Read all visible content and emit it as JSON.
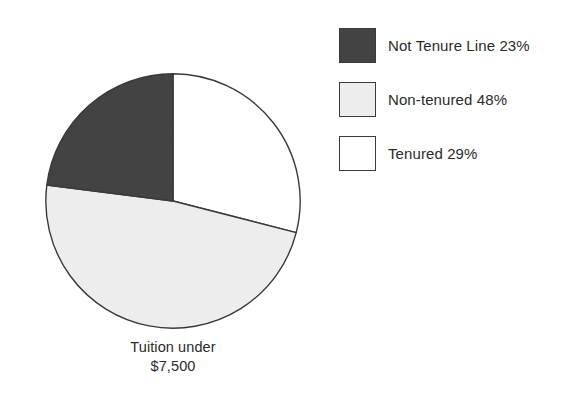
{
  "chart_data": {
    "type": "pie",
    "title": "",
    "caption_line1": "Tuition under",
    "caption_line2": "$7,500",
    "legend_position": "right",
    "grid": false,
    "start_angle_deg": 0,
    "direction": "clockwise",
    "categories": [
      "Tenured",
      "Non-tenured",
      "Not Tenure Line"
    ],
    "values": [
      29,
      48,
      23
    ],
    "value_unit": "%",
    "slices": [
      {
        "name": "Tenured",
        "label": "Tenured 29%",
        "value": 29,
        "color": "#ffffff",
        "start_deg": 0,
        "end_deg": 104.4
      },
      {
        "name": "Non-tenured",
        "label": "Non-tenured 48%",
        "value": 48,
        "color": "#ededed",
        "start_deg": 104.4,
        "end_deg": 277.2
      },
      {
        "name": "Not Tenure Line",
        "label": "Not Tenure Line 23%",
        "value": 23,
        "color": "#434343",
        "start_deg": 277.2,
        "end_deg": 360
      }
    ]
  },
  "legend": {
    "items": [
      {
        "label": "Not Tenure Line 23%",
        "color": "#434343",
        "swatch_name": "legend-swatch-not-tenure-line"
      },
      {
        "label": "Non-tenured 48%",
        "color": "#ededed",
        "swatch_name": "legend-swatch-non-tenured"
      },
      {
        "label": "Tenured 29%",
        "color": "#ffffff",
        "swatch_name": "legend-swatch-tenured"
      }
    ]
  },
  "caption": {
    "line1": "Tuition under",
    "line2": "$7,500"
  },
  "style": {
    "outline_color": "#3a3a3a",
    "text_color": "#2b2b2b",
    "background": "#ffffff"
  }
}
